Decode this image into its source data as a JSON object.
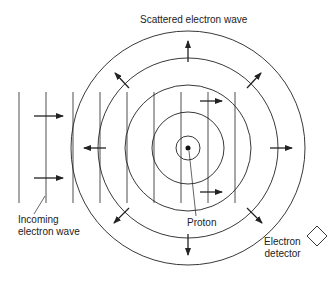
{
  "diagram": {
    "title": "Scattered electron wave",
    "labels": {
      "incoming_line1": "Incoming",
      "incoming_line2": "electron wave",
      "proton": "Proton",
      "detector_line1": "Electron",
      "detector_line2": "detector"
    },
    "center": {
      "x": 188,
      "y": 148
    },
    "circle_radii": [
      12,
      36,
      63,
      90,
      117
    ],
    "incoming_wavefront_x": [
      19,
      46,
      73,
      100,
      127,
      154,
      181,
      208,
      235
    ],
    "wavefront_y_range": [
      92,
      203
    ],
    "colors": {
      "stroke": "#222222",
      "background": "#ffffff"
    }
  }
}
